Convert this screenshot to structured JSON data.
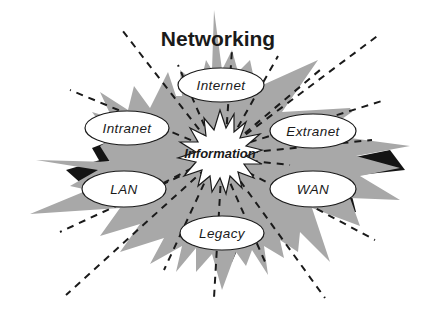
{
  "diagram": {
    "title": "Networking",
    "center": {
      "label": "Information",
      "shape": "starburst"
    },
    "nodes": [
      {
        "id": "internet",
        "label": "Internet",
        "cx": 221,
        "cy": 85,
        "rx": 43,
        "ry": 17
      },
      {
        "id": "intranet",
        "label": "Intranet",
        "cx": 127,
        "cy": 128,
        "rx": 42,
        "ry": 17
      },
      {
        "id": "extranet",
        "label": "Extranet",
        "cx": 313,
        "cy": 131,
        "rx": 43,
        "ry": 17
      },
      {
        "id": "lan",
        "label": "LAN",
        "cx": 124,
        "cy": 189,
        "rx": 42,
        "ry": 18
      },
      {
        "id": "wan",
        "label": "WAN",
        "cx": 313,
        "cy": 189,
        "rx": 43,
        "ry": 18
      },
      {
        "id": "legacy",
        "label": "Legacy",
        "cx": 222,
        "cy": 233,
        "rx": 42,
        "ry": 17
      }
    ],
    "colors": {
      "spike_fill": "#a8a8a8",
      "shadow_fill": "#141414",
      "ellipse_fill": "#ffffff",
      "line": "#1a1a1a",
      "background": "#ffffff"
    }
  }
}
